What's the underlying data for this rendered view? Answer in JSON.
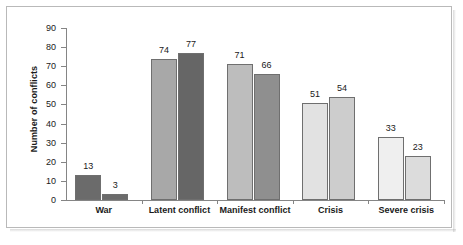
{
  "chart_data": {
    "type": "bar",
    "title": "",
    "xlabel": "",
    "ylabel": "Number of conflicts",
    "ylim": [
      0,
      90
    ],
    "yticks": [
      0,
      10,
      20,
      30,
      40,
      50,
      60,
      70,
      80,
      90
    ],
    "grid": false,
    "legend": "none",
    "categories": [
      "War",
      "Latent conflict",
      "Manifest conflict",
      "Crisis",
      "Severe crisis"
    ],
    "series": [
      {
        "name": "series-1",
        "values": [
          13,
          74,
          71,
          51,
          33
        ],
        "colors": [
          "#6b6b6b",
          "#a8a8a8",
          "#bdbdbd",
          "#e2e2e2",
          "#efefef"
        ]
      },
      {
        "name": "series-2",
        "values": [
          3,
          77,
          66,
          54,
          23
        ],
        "colors": [
          "#6b6b6b",
          "#666666",
          "#8f8f8f",
          "#cdcdcd",
          "#dcdcdc"
        ]
      }
    ],
    "bar_edge_color": "#6f6f6f",
    "axis_color": "#858585"
  },
  "axis": {
    "y_title": "Number of conflicts",
    "y_tick_labels": [
      "90",
      "80",
      "70",
      "60",
      "50",
      "40",
      "30",
      "20",
      "10",
      "0"
    ]
  },
  "bars": [
    {
      "label": "13",
      "value": 13,
      "group": "War",
      "color": "#6b6b6b"
    },
    {
      "label": "3",
      "value": 3,
      "group": "War",
      "color": "#6b6b6b"
    },
    {
      "label": "74",
      "value": 74,
      "group": "Latent conflict",
      "color": "#a8a8a8"
    },
    {
      "label": "77",
      "value": 77,
      "group": "Latent conflict",
      "color": "#666666"
    },
    {
      "label": "71",
      "value": 71,
      "group": "Manifest conflict",
      "color": "#bdbdbd"
    },
    {
      "label": "66",
      "value": 66,
      "group": "Manifest conflict",
      "color": "#8f8f8f"
    },
    {
      "label": "51",
      "value": 51,
      "group": "Crisis",
      "color": "#e2e2e2"
    },
    {
      "label": "54",
      "value": 54,
      "group": "Crisis",
      "color": "#cdcdcd"
    },
    {
      "label": "33",
      "value": 33,
      "group": "Severe crisis",
      "color": "#efefef"
    },
    {
      "label": "23",
      "value": 23,
      "group": "Severe crisis",
      "color": "#dcdcdc"
    }
  ],
  "groups": [
    {
      "label": "War"
    },
    {
      "label": "Latent conflict"
    },
    {
      "label": "Manifest conflict"
    },
    {
      "label": "Crisis"
    },
    {
      "label": "Severe crisis"
    }
  ]
}
